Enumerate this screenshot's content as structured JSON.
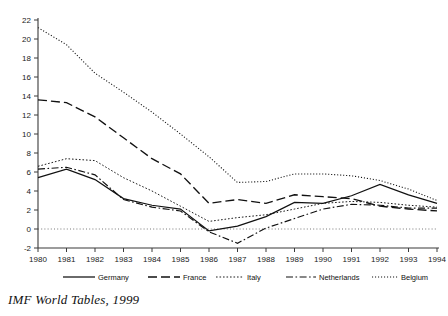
{
  "source_note": "IMF World Tables, 1999",
  "legend": {
    "position": "bottom",
    "items": [
      {
        "label": "Germany",
        "style": "solid"
      },
      {
        "label": "France",
        "style": "long-dash"
      },
      {
        "label": "Italy",
        "style": "dash-dot-fine"
      },
      {
        "label": "Netherlands",
        "style": "dash-dot"
      },
      {
        "label": "Belgium",
        "style": "dotted"
      }
    ]
  },
  "chart_data": {
    "type": "line",
    "title": "",
    "subtitle": "",
    "xlabel": "",
    "ylabel": "",
    "grid": false,
    "legend_position": "bottom",
    "x": [
      1980,
      1981,
      1982,
      1983,
      1984,
      1985,
      1986,
      1987,
      1988,
      1989,
      1990,
      1991,
      1992,
      1993,
      1994
    ],
    "xtick_labels": [
      "1980",
      "1981",
      "1982",
      "1983",
      "1984",
      "1985",
      "1986",
      "1987",
      "1988",
      "1989",
      "1990",
      "1991",
      "1992",
      "1993",
      "1994"
    ],
    "xlim": [
      1980,
      1994
    ],
    "ylim": [
      -2,
      22
    ],
    "ytick_labels": [
      "-2",
      "0",
      "2",
      "4",
      "6",
      "8",
      "10",
      "12",
      "14",
      "16",
      "18",
      "20",
      "22"
    ],
    "yticks": [
      -2,
      0,
      2,
      4,
      6,
      8,
      10,
      12,
      14,
      16,
      18,
      20,
      22
    ],
    "zero_reference_line": 0,
    "series": [
      {
        "name": "Germany",
        "style": "solid",
        "values": [
          5.4,
          6.3,
          5.2,
          3.2,
          2.5,
          2.1,
          -0.2,
          0.3,
          1.3,
          2.8,
          2.7,
          3.5,
          4.7,
          3.6,
          2.7
        ]
      },
      {
        "name": "France",
        "style": "long-dash",
        "values": [
          13.6,
          13.3,
          11.8,
          9.6,
          7.4,
          5.8,
          2.7,
          3.1,
          2.7,
          3.6,
          3.4,
          3.2,
          2.4,
          2.1,
          1.9
        ]
      },
      {
        "name": "Italy",
        "style": "dash-dot-fine",
        "values": [
          6.6,
          7.4,
          7.2,
          5.4,
          4.0,
          2.4,
          0.8,
          1.2,
          1.5,
          2.1,
          2.7,
          2.9,
          2.8,
          2.5,
          2.3
        ]
      },
      {
        "name": "Netherlands",
        "style": "dash-dot",
        "values": [
          6.3,
          6.5,
          5.7,
          3.1,
          2.3,
          1.9,
          -0.3,
          -1.5,
          0.1,
          1.1,
          2.1,
          2.6,
          2.5,
          2.2,
          2.2
        ]
      },
      {
        "name": "Belgium",
        "style": "dotted",
        "values": [
          21.2,
          19.4,
          16.4,
          14.4,
          12.3,
          10.0,
          7.6,
          4.9,
          5.0,
          5.8,
          5.8,
          5.6,
          5.1,
          4.2,
          3.0
        ]
      }
    ]
  }
}
